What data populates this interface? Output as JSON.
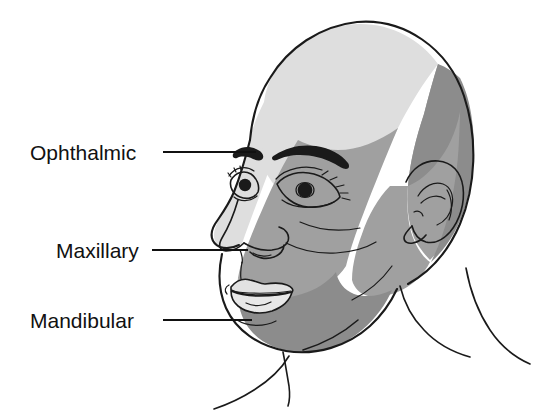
{
  "figure": {
    "background_color": "#ffffff",
    "outline_color": "#1a1a1a"
  },
  "labels": [
    {
      "id": "ophthalmic",
      "text": "Ophthalmic",
      "region_name": "ophthalmic-division",
      "zone_color": "#dedede",
      "text_x": 30,
      "text_y": 160,
      "leader_x1": 163,
      "leader_y1": 152,
      "leader_x2": 256,
      "leader_y2": 152
    },
    {
      "id": "maxillary",
      "text": "Maxillary",
      "region_name": "maxillary-division",
      "zone_color": "#a0a0a0",
      "text_x": 56,
      "text_y": 258,
      "leader_x1": 152,
      "leader_y1": 250,
      "leader_x2": 248,
      "leader_y2": 250
    },
    {
      "id": "mandibular",
      "text": "Mandibular",
      "region_name": "mandibular-division",
      "zone_color": "#8c8c8c",
      "text_x": 30,
      "text_y": 328,
      "leader_x1": 163,
      "leader_y1": 320,
      "leader_x2": 252,
      "leader_y2": 320
    }
  ],
  "zones": {
    "ophthalmic_color": "#dedede",
    "maxillary_color": "#a0a0a0",
    "mandibular_color": "#8c8c8c",
    "skin_color": "#ffffff"
  }
}
